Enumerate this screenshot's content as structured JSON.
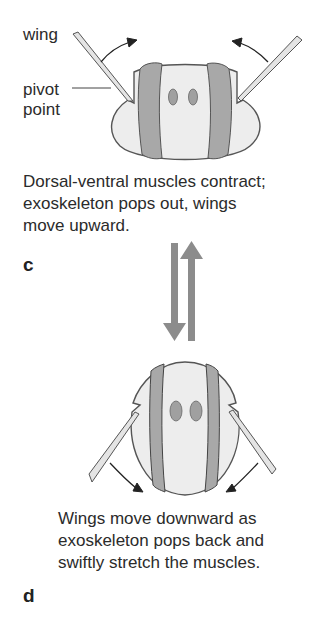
{
  "labels": {
    "wing": "wing",
    "pivot_point_line1": "pivot",
    "pivot_point_line2": "point"
  },
  "panel_c": {
    "letter": "c",
    "caption_line1": "Dorsal-ventral muscles contract;",
    "caption_line2": "exoskeleton pops out, wings",
    "caption_line3": "move upward."
  },
  "panel_d": {
    "letter": "d",
    "caption_line1": "Wings move downward as",
    "caption_line2": "exoskeleton pops back and",
    "caption_line3": "swiftly stretch the muscles."
  },
  "icons": {
    "cycle": "down-arrow + up-arrow (reversible transition)"
  },
  "colors": {
    "body_fill": "#ededed",
    "muscle_fill": "#a8a8a8",
    "outline": "#555555",
    "arrow_fill": "#8a8a8a",
    "text": "#2b2b2b"
  }
}
